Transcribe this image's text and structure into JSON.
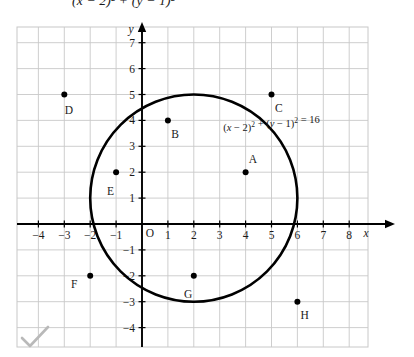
{
  "top_partial_text": "(x − 2)² + (y − 1)²",
  "figure": {
    "equation_label": "(x − 2)² + (y − 1)² = 16",
    "x_axis_letter": "x",
    "y_axis_letter": "y",
    "origin_label": "O",
    "x_tick_labels": [
      "−4",
      "−3",
      "−2",
      "−1",
      "1",
      "2",
      "3",
      "4",
      "5",
      "6",
      "7",
      "8"
    ],
    "y_tick_labels": [
      "7",
      "6",
      "5",
      "4",
      "3",
      "2",
      "1",
      "−1",
      "−2",
      "−3",
      "−4"
    ],
    "grid_color": "#c8c8c8",
    "axis_color": "#000000",
    "curve_color": "#000000",
    "point_color": "#000000"
  },
  "chart_data": {
    "type": "scatter",
    "title": "",
    "xlabel": "x",
    "ylabel": "y",
    "xlim": [
      -4.8,
      8.8
    ],
    "ylim": [
      -4.6,
      7.6
    ],
    "xticks": [
      -4,
      -3,
      -2,
      -1,
      1,
      2,
      3,
      4,
      5,
      6,
      7,
      8
    ],
    "yticks": [
      7,
      6,
      5,
      4,
      3,
      2,
      1,
      -1,
      -2,
      -3,
      -4
    ],
    "grid": true,
    "legend": "none",
    "annotations": [
      {
        "text": "(x − 2)² + (y − 1)² = 16",
        "x": 5.0,
        "y": 3.6
      }
    ],
    "shapes": [
      {
        "kind": "circle",
        "center": [
          2,
          1
        ],
        "radius": 4,
        "equation": "(x − 2)² + (y − 1)² = 16",
        "stroke": "#000000",
        "fill": "none"
      }
    ],
    "points": [
      {
        "label": "A",
        "x": 4,
        "y": 2,
        "label_dx": 0.28,
        "label_dy": 0.52
      },
      {
        "label": "B",
        "x": 1,
        "y": 4,
        "label_dx": 0.28,
        "label_dy": -0.52
      },
      {
        "label": "C",
        "x": 5,
        "y": 5,
        "label_dx": 0.28,
        "label_dy": -0.52
      },
      {
        "label": "D",
        "x": -3,
        "y": 5,
        "label_dx": 0.18,
        "label_dy": -0.58
      },
      {
        "label": "E",
        "x": -1,
        "y": 2,
        "label_dx": -0.22,
        "label_dy": -0.72
      },
      {
        "label": "F",
        "x": -2,
        "y": -2,
        "label_dx": -0.62,
        "label_dy": -0.3
      },
      {
        "label": "G",
        "x": 2,
        "y": -2,
        "label_dx": -0.22,
        "label_dy": -0.72
      },
      {
        "label": "H",
        "x": 6,
        "y": -3,
        "label_dx": 0.28,
        "label_dy": -0.52
      }
    ]
  },
  "watermark": {
    "checkmark": "✓"
  }
}
